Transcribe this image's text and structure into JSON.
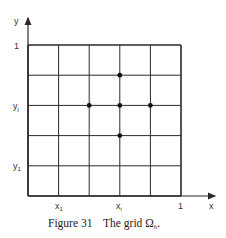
{
  "figure": {
    "caption_label": "Figure 31",
    "caption_text": "The grid Ω",
    "caption_subscript": "h",
    "caption_end": "."
  },
  "axes": {
    "x_label": "x",
    "y_label": "y",
    "x_ticks": [
      {
        "label": "x",
        "sub": "1"
      },
      {
        "label": "x",
        "sub": "i"
      },
      {
        "label": "1",
        "sub": ""
      }
    ],
    "y_ticks": [
      {
        "label": "1",
        "sub": ""
      },
      {
        "label": "y",
        "sub": "j"
      },
      {
        "label": "y",
        "sub": "1"
      }
    ]
  },
  "grid": {
    "divisions": 5,
    "stencil_points": [
      {
        "i": 3,
        "j": 4
      },
      {
        "i": 2,
        "j": 3
      },
      {
        "i": 3,
        "j": 3
      },
      {
        "i": 4,
        "j": 3
      },
      {
        "i": 3,
        "j": 2
      }
    ],
    "line_color": "#2a2a2a",
    "point_color": "#111111"
  }
}
